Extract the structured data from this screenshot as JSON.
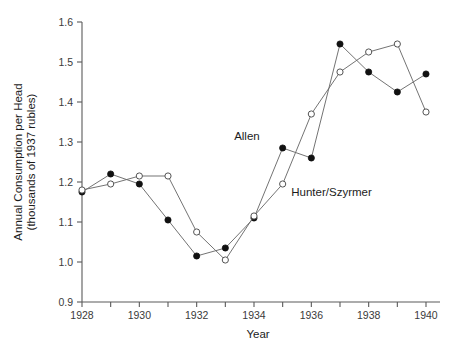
{
  "chart_data": {
    "type": "line",
    "title": "",
    "xlabel": "Year",
    "ylabel": "Annual Consumption per Head (thousands of 1937 rubles)",
    "ylabel_line1": "Annual Consumption per Head",
    "ylabel_line2": "(thousands of 1937 rubles)",
    "x": [
      1928,
      1929,
      1930,
      1931,
      1932,
      1933,
      1934,
      1935,
      1936,
      1937,
      1938,
      1939,
      1940
    ],
    "xlim": [
      1927.5,
      1940.5
    ],
    "ylim": [
      0.9,
      1.6
    ],
    "grid": false,
    "legend_position": "inline-annotation",
    "x_tick_values": [
      1928,
      1929,
      1930,
      1931,
      1932,
      1933,
      1934,
      1935,
      1936,
      1937,
      1938,
      1939,
      1940
    ],
    "x_tick_labels": [
      "1928",
      "",
      "1930",
      "",
      "1932",
      "",
      "1934",
      "",
      "1936",
      "",
      "1938",
      "",
      "1940"
    ],
    "y_tick_values": [
      0.9,
      1.0,
      1.1,
      1.2,
      1.3,
      1.4,
      1.5,
      1.6
    ],
    "y_tick_labels": [
      "0.9",
      "1.0",
      "1.1",
      "1.2",
      "1.3",
      "1.4",
      "1.5",
      "1.6"
    ],
    "series": [
      {
        "name": "Allen",
        "marker": "filled-circle",
        "color": "#111111",
        "values": [
          1.175,
          1.22,
          1.195,
          1.105,
          1.015,
          1.035,
          1.11,
          1.285,
          1.26,
          1.545,
          1.475,
          1.425,
          1.47
        ]
      },
      {
        "name": "Hunter/Szyrmer",
        "marker": "open-circle",
        "color": "#555555",
        "values": [
          1.18,
          1.195,
          1.215,
          1.215,
          1.075,
          1.005,
          1.115,
          1.195,
          1.37,
          1.475,
          1.525,
          1.545,
          1.375
        ]
      }
    ],
    "annotations": [
      {
        "text": "Allen",
        "x": 1934.2,
        "y": 1.305,
        "anchor": "end"
      },
      {
        "text": "Hunter/Szyrmer",
        "x": 1935.3,
        "y": 1.165,
        "anchor": "start"
      }
    ]
  },
  "colors": {
    "axis": "#5a5a5a",
    "line": "#6b6b6b",
    "filled_marker": "#111111",
    "open_marker_stroke": "#555555",
    "background": "#ffffff",
    "text": "#1c1c1c"
  }
}
